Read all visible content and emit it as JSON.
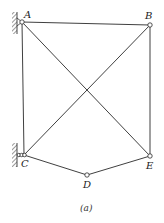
{
  "figure": {
    "caption": "(a)",
    "colors": {
      "line": "#2a2a2a",
      "hatch": "#555555",
      "background": "#ffffff"
    }
  },
  "nodes": [
    {
      "id": "A",
      "label": "A",
      "x": 22,
      "y": 22,
      "support": "pin-wall"
    },
    {
      "id": "B",
      "label": "B",
      "x": 150,
      "y": 25,
      "support": "none"
    },
    {
      "id": "C",
      "label": "C",
      "x": 24,
      "y": 155,
      "support": "roller-wall"
    },
    {
      "id": "D",
      "label": "D",
      "x": 87,
      "y": 175,
      "support": "none"
    },
    {
      "id": "E",
      "label": "E",
      "x": 150,
      "y": 156,
      "support": "none"
    }
  ],
  "members": [
    [
      "A",
      "B"
    ],
    [
      "A",
      "C"
    ],
    [
      "A",
      "E"
    ],
    [
      "B",
      "C"
    ],
    [
      "B",
      "E"
    ],
    [
      "C",
      "D"
    ],
    [
      "D",
      "E"
    ]
  ]
}
